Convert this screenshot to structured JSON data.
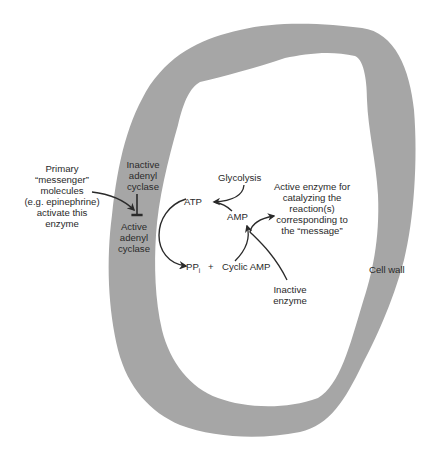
{
  "diagram": {
    "type": "cell signaling schematic",
    "colors": {
      "cell_wall": "#a6a6a6",
      "background": "#ffffff",
      "ink": "#2a2a2a"
    },
    "labels": {
      "primary_messenger": [
        "Primary",
        "“messenger”",
        "molecules",
        "(e.g. epinephrine)",
        "activate this",
        "enzyme"
      ],
      "inactive_adenyl_cyclase": [
        "Inactive",
        "adenyl",
        "cyclase"
      ],
      "active_adenyl_cyclase": [
        "Active",
        "adenyl",
        "cyclase"
      ],
      "glycolysis": "Glycolysis",
      "atp": "ATP",
      "amp": "AMP",
      "ppi": "PP",
      "ppi_subscript": "i",
      "plus": "+",
      "cyclic_amp": "Cyclic AMP",
      "active_enzyme": [
        "Active enzyme for",
        "catalyzing the",
        "reaction(s)",
        "corresponding to",
        "the “message”"
      ],
      "inactive_enzyme": [
        "Inactive",
        "enzyme"
      ],
      "cell_wall": "Cell wall"
    }
  }
}
